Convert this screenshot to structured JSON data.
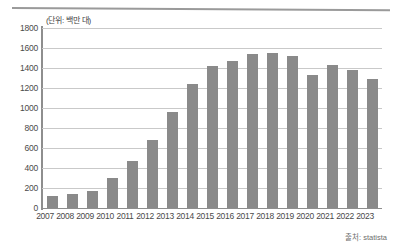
{
  "chart_data": {
    "type": "bar",
    "title": "",
    "subtitle": "",
    "unit_label": "(단위: 백만 대)",
    "xlabel": "",
    "ylabel": "",
    "ylim": [
      0,
      1800
    ],
    "ytick_step": 200,
    "grid": true,
    "legend": null,
    "bar_color": "#8a8a8a",
    "categories": [
      "2007",
      "2008",
      "2009",
      "2010",
      "2011",
      "2012",
      "2013",
      "2014",
      "2015",
      "2016",
      "2017",
      "2018",
      "2019",
      "2020",
      "2021",
      "2022",
      "2023"
    ],
    "values": [
      122,
      139,
      173,
      297,
      472,
      680,
      960,
      1245,
      1420,
      1470,
      1540,
      1555,
      1520,
      1330,
      1430,
      1380,
      1290
    ],
    "ytick_labels": [
      "1800",
      "1600",
      "1400",
      "1200",
      "1000",
      "800",
      "600",
      "400",
      "200",
      "0"
    ],
    "ytick_values": [
      1800,
      1600,
      1400,
      1200,
      1000,
      800,
      600,
      400,
      200,
      0
    ]
  },
  "source": {
    "text": "출처: statista"
  },
  "colors": {
    "bar": "#8a8a8a",
    "grid": "#c9c9c9",
    "axis": "#8e8e8e",
    "rule": "#9a9a9a",
    "text": "#4a4a4a"
  }
}
